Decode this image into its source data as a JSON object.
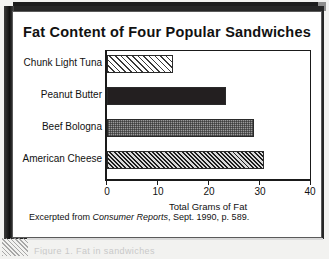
{
  "figure": {
    "title": "Fat Content of Four Popular Sandwiches",
    "source_prefix": "Excerpted from",
    "source_italic": "Consumer Reports",
    "source_suffix": ", Sept. 1990, p. 589.",
    "ghost_caption": "Figure 1. Fat in sandwiches"
  },
  "chart_data": {
    "type": "bar",
    "orientation": "horizontal",
    "title": "Fat Content of Four Popular Sandwiches",
    "categories": [
      "Chunk Light Tuna",
      "Peanut Butter",
      "Beef Bologna",
      "American Cheese"
    ],
    "values": [
      13,
      23.5,
      29,
      31
    ],
    "xlabel": "Total Grams of Fat",
    "ylabel": "",
    "xlim": [
      0,
      40
    ],
    "xticks": [
      0,
      10,
      20,
      30,
      40
    ],
    "xticklabels": [
      "0",
      "10",
      "20",
      "30",
      "40"
    ],
    "grid": false,
    "legend": false,
    "bar_fills": [
      "light-diagonal-hatch",
      "solid-black",
      "gray-checker",
      "dense-diagonal-hatch"
    ]
  },
  "colors": {
    "frame": "#262626",
    "ink": "#111111",
    "bar_dark": "#231f20",
    "bar_gray": "#9a9a9a",
    "page": "#f2f2f0"
  }
}
